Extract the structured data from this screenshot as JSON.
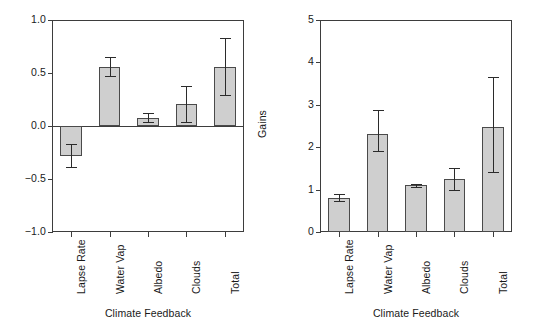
{
  "chart_data": [
    {
      "type": "bar",
      "panel": "left",
      "title": "",
      "xlabel": "Climate Feedback",
      "ylabel": "Feedback Factor",
      "categories": [
        "Lapse Rate",
        "Water Vap",
        "Albedo",
        "Clouds",
        "Total"
      ],
      "values": [
        -0.28,
        0.56,
        0.08,
        0.21,
        0.56
      ],
      "error_low": [
        -0.39,
        0.47,
        0.04,
        0.04,
        0.29
      ],
      "error_high": [
        -0.17,
        0.65,
        0.12,
        0.38,
        0.83
      ],
      "ylim": [
        -1.0,
        1.0
      ],
      "yticks": [
        1.0,
        0.5,
        0.0,
        -0.5,
        -1.0
      ],
      "ytick_labels": [
        "1.0",
        "0.5",
        "0.0",
        "−0.5",
        "−1.0"
      ],
      "grid": false,
      "legend": "none"
    },
    {
      "type": "bar",
      "panel": "right",
      "title": "",
      "xlabel": "Climate Feedback",
      "ylabel": "Gains",
      "categories": [
        "Lapse Rate",
        "Water Vap",
        "Albedo",
        "Clouds",
        "Total"
      ],
      "values": [
        0.8,
        2.3,
        1.1,
        1.25,
        2.48
      ],
      "error_low": [
        0.73,
        1.92,
        1.06,
        1.0,
        1.42
      ],
      "error_high": [
        0.9,
        2.87,
        1.14,
        1.52,
        3.65
      ],
      "ylim": [
        0,
        5
      ],
      "yticks": [
        5,
        4,
        3,
        2,
        1,
        0
      ],
      "ytick_labels": [
        "5",
        "4",
        "3",
        "2",
        "1",
        "0"
      ],
      "grid": false,
      "legend": "none"
    }
  ],
  "style": {
    "bar_fill": "#cfcfcf",
    "bar_edge": "#4a4a4a",
    "axis_color": "#3d3d3d",
    "error_color": "#2b2b2b",
    "background": "#ffffff"
  }
}
